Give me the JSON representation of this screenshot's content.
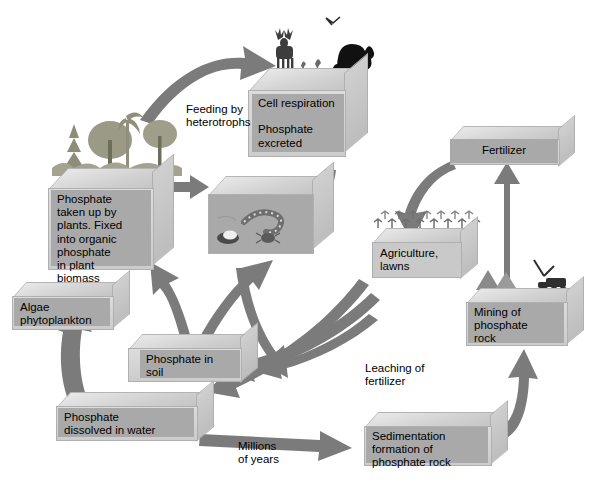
{
  "diagram": {
    "background_color": "#ffffff",
    "arrow_color": "#7a7a7a",
    "block_label_color": "#a9a9a9",
    "blocks": [
      {
        "id": "consumers",
        "label": "Cell respiration\n\nPhosphate\nexcreted",
        "scene": "deer, bear, bird, small animals"
      },
      {
        "id": "plants",
        "label": "Phosphate\ntaken up by\nplants. Fixed\ninto organic\nphosphate\nin plant\nbiomass",
        "scene": "conifer, shrub, broadleaf trees"
      },
      {
        "id": "decomposers",
        "label": "",
        "scene": "earthworm, beetle, fungi"
      },
      {
        "id": "algae",
        "label": "Algae\nphytoplankton",
        "scene": ""
      },
      {
        "id": "soil",
        "label": "Phosphate in\nsoil",
        "scene": ""
      },
      {
        "id": "water",
        "label": "Phosphate\ndissolved in water",
        "scene": ""
      },
      {
        "id": "agriculture",
        "label": "Agriculture,\nlawns",
        "scene": "rows of crops"
      },
      {
        "id": "fertilizer",
        "label": "Fertilizer",
        "scene": ""
      },
      {
        "id": "mining",
        "label": "Mining of\nphosphate\nrock",
        "scene": "excavator, rock piles"
      },
      {
        "id": "sedimentation",
        "label": "Sedimentation\nformation of\nphosphate rock",
        "scene": ""
      }
    ],
    "annotations": [
      {
        "id": "feeding",
        "text": "Feeding by\nheterotrophs"
      },
      {
        "id": "leaching",
        "text": "Leaching of\nfertilizer"
      },
      {
        "id": "millions",
        "text": "Millions\nof years"
      }
    ]
  }
}
